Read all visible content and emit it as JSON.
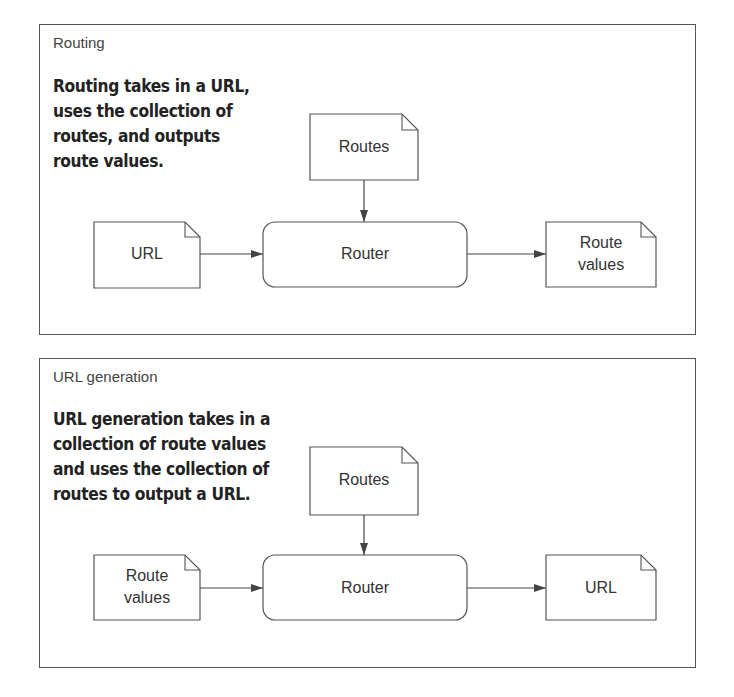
{
  "panels": [
    {
      "title": "Routing",
      "description": "Routing takes in a URL,\nuses the collection of\nroutes, and outputs\nroute values.",
      "nodes": {
        "top_doc": "Routes",
        "input_doc": "URL",
        "router": "Router",
        "output_doc": "Route\nvalues"
      }
    },
    {
      "title": "URL generation",
      "description": "URL generation takes in a\ncollection of route values\nand uses the collection of\nroutes to output a URL.",
      "nodes": {
        "top_doc": "Routes",
        "input_doc": "Route\nvalues",
        "router": "Router",
        "output_doc": "URL"
      }
    }
  ],
  "colors": {
    "stroke": "#555555",
    "text": "#333333",
    "background": "#ffffff"
  }
}
